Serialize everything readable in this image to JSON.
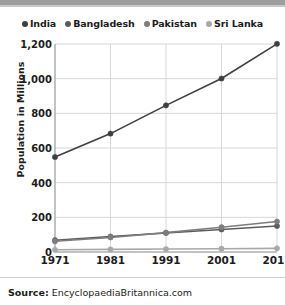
{
  "chart_data": {
    "type": "line",
    "title": "",
    "subtitle": "",
    "xlabel": "",
    "ylabel": "Population in Millions",
    "categories": [
      "1971",
      "1981",
      "1991",
      "2001",
      "2011"
    ],
    "x": [
      1971,
      1981,
      1991,
      2001,
      2011
    ],
    "ylim": [
      0,
      1200
    ],
    "yticks": [
      0,
      200,
      400,
      600,
      800,
      1000,
      1200
    ],
    "ytick_labels": [
      "0",
      "200",
      "400",
      "600",
      "800",
      "1,000",
      "1,200"
    ],
    "grid": true,
    "legend_position": "top-center",
    "series": [
      {
        "name": "India",
        "color": "#3f3f3f",
        "marker": "circle",
        "values": [
          548,
          683,
          846,
          1001,
          1201
        ]
      },
      {
        "name": "Bangladesh",
        "color": "#5c5c5c",
        "marker": "circle",
        "values": [
          68,
          89,
          110,
          130,
          150
        ]
      },
      {
        "name": "Pakistan",
        "color": "#7d7d7d",
        "marker": "circle",
        "values": [
          62,
          84,
          112,
          143,
          176
        ]
      },
      {
        "name": "Sri Lanka",
        "color": "#a8a8a8",
        "marker": "circle",
        "values": [
          13,
          15,
          17,
          19,
          21
        ]
      }
    ]
  },
  "legend": {
    "items": [
      {
        "label": "India",
        "color": "#3f3f3f"
      },
      {
        "label": "Bangladesh",
        "color": "#5c5c5c"
      },
      {
        "label": "Pakistan",
        "color": "#7d7d7d"
      },
      {
        "label": "Sri Lanka",
        "color": "#a8a8a8"
      }
    ]
  },
  "footer": {
    "source_label": "Source:",
    "source_text": "EncyclopaediaBritannica.com"
  },
  "style": {
    "grid_color": "#d8d8d8",
    "axis_color": "#9a9a9a",
    "text_color": "#1c1c1c",
    "top_bar_color": "#9d9d9d",
    "background": "#ffffff"
  }
}
